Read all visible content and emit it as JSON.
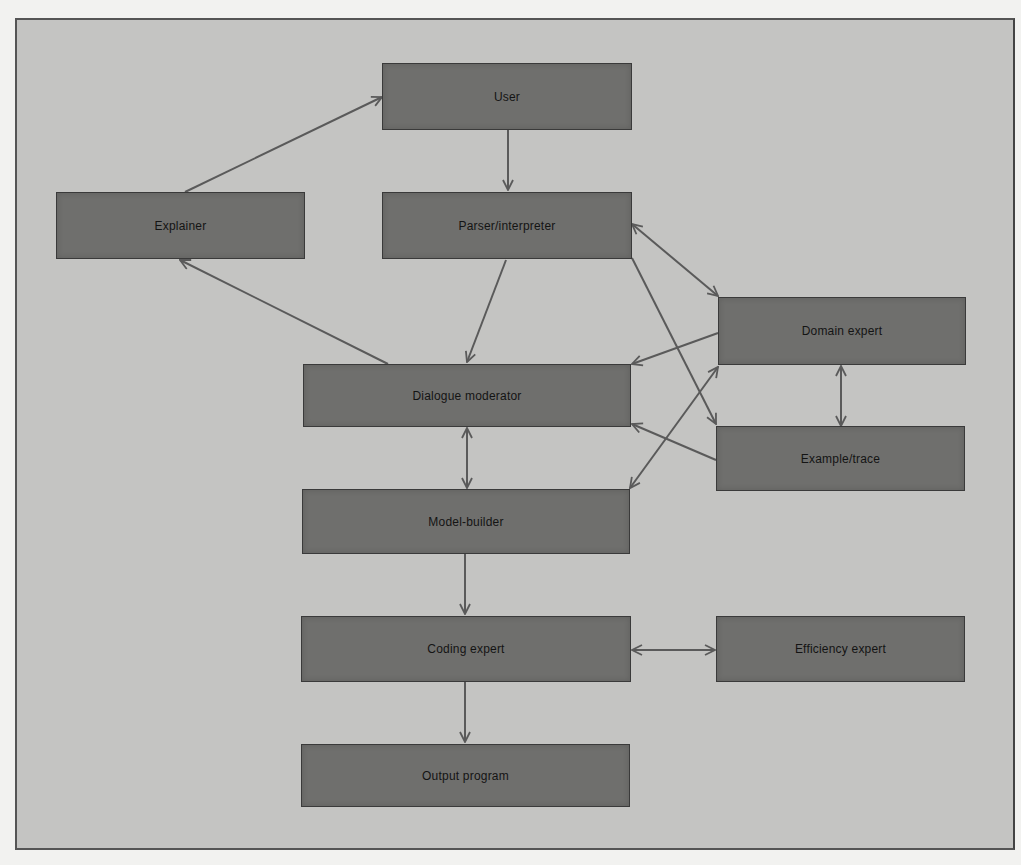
{
  "diagram": {
    "colors": {
      "background": "#c4c4c2",
      "box_fill": "#6f6f6d",
      "box_border": "#3a3a3a",
      "arrow": "#5a5a5a",
      "text": "#141414"
    },
    "nodes": [
      {
        "id": "user",
        "label": "User"
      },
      {
        "id": "explainer",
        "label": "Explainer"
      },
      {
        "id": "parser",
        "label": "Parser/interpreter"
      },
      {
        "id": "domain",
        "label": "Domain expert"
      },
      {
        "id": "dialogue",
        "label": "Dialogue moderator"
      },
      {
        "id": "example",
        "label": "Example/trace"
      },
      {
        "id": "model",
        "label": "Model-builder"
      },
      {
        "id": "coding",
        "label": "Coding expert"
      },
      {
        "id": "efficiency",
        "label": "Efficiency expert"
      },
      {
        "id": "output",
        "label": "Output program"
      }
    ],
    "edges": [
      {
        "from": "explainer",
        "to": "user",
        "direction": "forward"
      },
      {
        "from": "user",
        "to": "parser",
        "direction": "forward"
      },
      {
        "from": "dialogue",
        "to": "explainer",
        "direction": "forward"
      },
      {
        "from": "parser",
        "to": "dialogue",
        "direction": "forward"
      },
      {
        "from": "parser",
        "to": "domain",
        "direction": "both"
      },
      {
        "from": "parser",
        "to": "example",
        "direction": "forward"
      },
      {
        "from": "domain",
        "to": "dialogue",
        "direction": "forward"
      },
      {
        "from": "example",
        "to": "dialogue",
        "direction": "forward"
      },
      {
        "from": "model",
        "to": "domain",
        "direction": "both"
      },
      {
        "from": "domain",
        "to": "example",
        "direction": "both"
      },
      {
        "from": "dialogue",
        "to": "model",
        "direction": "both"
      },
      {
        "from": "model",
        "to": "coding",
        "direction": "forward"
      },
      {
        "from": "coding",
        "to": "efficiency",
        "direction": "both"
      },
      {
        "from": "coding",
        "to": "output",
        "direction": "forward"
      }
    ]
  }
}
